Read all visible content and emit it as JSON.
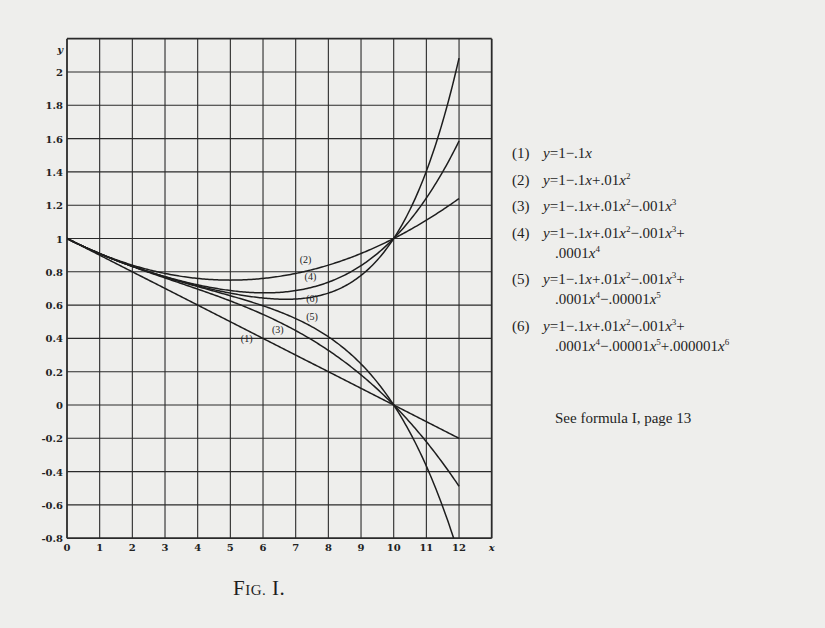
{
  "figure": {
    "caption_prefix": "F",
    "caption_smallcaps": "IG.",
    "caption_suffix": " I.",
    "caption": "FIG. I.",
    "note": "See formula I, page 13"
  },
  "legend": [
    {
      "num": "(1)",
      "lines": [
        "y=1−.1x"
      ]
    },
    {
      "num": "(2)",
      "lines": [
        "y=1−.1x+.01x²"
      ]
    },
    {
      "num": "(3)",
      "lines": [
        "y=1−.1x+.01x²−.001x³"
      ]
    },
    {
      "num": "(4)",
      "lines": [
        "y=1−.1x+.01x²−.001x³+",
        ".0001x⁴"
      ]
    },
    {
      "num": "(5)",
      "lines": [
        "y=1−.1x+.01x²−.001x³+",
        ".0001x⁴−.00001x⁵"
      ]
    },
    {
      "num": "(6)",
      "lines": [
        "y=1−.1x+.01x²−.001x³+",
        ".0001x⁴−.00001x⁵+.000001x⁶"
      ]
    }
  ],
  "chart_data": {
    "type": "line",
    "title": "Fig. I.",
    "xlabel": "x",
    "ylabel": "y",
    "xlim": [
      0,
      13
    ],
    "ylim": [
      -0.8,
      2.2
    ],
    "grid": true,
    "x_ticks": [
      "0",
      "1",
      "2",
      "3",
      "4",
      "5",
      "6",
      "7",
      "8",
      "9",
      "10",
      "11",
      "12"
    ],
    "x_axis_end_label": "x",
    "y_ticks": [
      "-0.8",
      "-0.6",
      "-0.4",
      "-0.2",
      "0",
      "0.2",
      "0.4",
      "0.6",
      "0.8",
      "1",
      "1.2",
      "1.4",
      "1.6",
      "1.8",
      "2"
    ],
    "y_axis_label": "y",
    "legend_position": "right",
    "annotation": "See formula I, page 13",
    "x": [
      0,
      1,
      2,
      3,
      4,
      5,
      6,
      7,
      8,
      9,
      10,
      11,
      12
    ],
    "series": [
      {
        "name": "(1)",
        "formula": "y=1-.1x",
        "coeffs": [
          1,
          -0.1
        ],
        "values": [
          1,
          0.9,
          0.8,
          0.7,
          0.6,
          0.5,
          0.4,
          0.3,
          0.2,
          0.1,
          0,
          -0.1,
          -0.2
        ],
        "label_at": [
          5.5,
          0.38
        ]
      },
      {
        "name": "(2)",
        "formula": "y=1-.1x+.01x^2",
        "coeffs": [
          1,
          -0.1,
          0.01
        ],
        "values": [
          1,
          0.91,
          0.84,
          0.79,
          0.76,
          0.75,
          0.76,
          0.79,
          0.84,
          0.91,
          1,
          1.11,
          1.24
        ],
        "label_at": [
          7.3,
          0.85
        ]
      },
      {
        "name": "(3)",
        "formula": "y=1-.1x+.01x^2-.001x^3",
        "coeffs": [
          1,
          -0.1,
          0.01,
          -0.001
        ],
        "values": [
          1,
          0.909,
          0.832,
          0.763,
          0.696,
          0.625,
          0.544,
          0.447,
          0.328,
          0.181,
          0,
          -0.221,
          -0.488
        ],
        "label_at": [
          6.45,
          0.43
        ]
      },
      {
        "name": "(4)",
        "formula": "y=1-.1x+.01x^2-.001x^3+.0001x^4",
        "coeffs": [
          1,
          -0.1,
          0.01,
          -0.001,
          0.0001
        ],
        "values": [
          1,
          0.9091,
          0.8336,
          0.7711,
          0.7216,
          0.6875,
          0.6736,
          0.6871,
          0.7376,
          0.8371,
          1,
          1.2431,
          1.5856
        ],
        "label_at": [
          7.45,
          0.75
        ]
      },
      {
        "name": "(5)",
        "formula": "y=1-.1x+.01x^2-.001x^3+.0001x^4-.00001x^5",
        "coeffs": [
          1,
          -0.1,
          0.01,
          -0.001,
          0.0001,
          -1e-05
        ],
        "values": [
          1,
          0.90909,
          0.83328,
          0.76867,
          0.71136,
          0.65625,
          0.59584,
          0.51903,
          0.40992,
          0.24661,
          0,
          -0.36741,
          -0.90224
        ],
        "label_at": [
          7.5,
          0.51
        ]
      },
      {
        "name": "(6)",
        "formula": "y=1-.1x+.01x^2-.001x^3+.0001x^4-.00001x^5+.000001x^6",
        "coeffs": [
          1,
          -0.1,
          0.01,
          -0.001,
          0.0001,
          -1e-05,
          1e-06
        ],
        "values": [
          1,
          0.909091,
          0.833344,
          0.769399,
          0.715456,
          0.671875,
          0.642496,
          0.636679,
          0.672064,
          0.778051,
          1,
          1.404151,
          2.083744
        ],
        "label_at": [
          7.5,
          0.62
        ]
      }
    ]
  }
}
